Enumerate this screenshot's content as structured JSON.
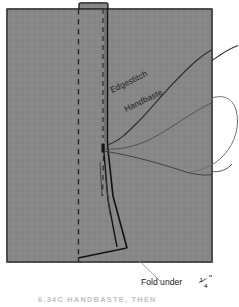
{
  "figure": {
    "fabric": {
      "color": "#878787",
      "edge_color": "#1a1a1a",
      "x": 7,
      "y": 9,
      "width": 205,
      "height": 253
    },
    "notch": {
      "label": "top-tab",
      "x": 79,
      "y": 3,
      "width": 29,
      "height": 7
    },
    "labels": [
      {
        "id": "edgestitch",
        "text": "Edgestitch",
        "x": 112,
        "y": 93,
        "rotation": -26
      },
      {
        "id": "handbaste",
        "text": "Handbaste",
        "x": 126,
        "y": 112,
        "rotation": -26
      }
    ],
    "callout": {
      "id": "fold-under",
      "text_before": "Fold under ",
      "fraction_numerator": "1",
      "fraction_denominator": "4",
      "unit": "\"",
      "x": 141,
      "y": 285
    },
    "caption": {
      "text": "6.34C  HANDBASTE, THEN",
      "x": 38,
      "y": 302,
      "color": "#c2c2c2"
    },
    "stitch_lines": {
      "basting_dash_color": "#232323",
      "edgestitch_color": "#111111",
      "thread_color": "#3a3a3a"
    }
  }
}
